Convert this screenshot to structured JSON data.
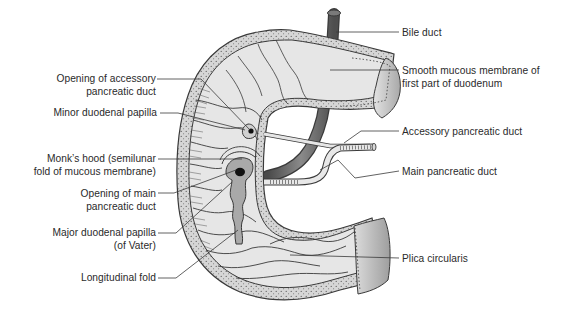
{
  "diagram": {
    "colors": {
      "background": "#ffffff",
      "wall_fill": "#d8d8d8",
      "mucosa_fill": "#e6e6e6",
      "outline": "#3a3a3a",
      "duct_dark": "#6b6b6b",
      "papilla_fill": "#a9a9a9",
      "cut_end_fill": "#bdbdbd",
      "label_text": "#2a2a2a"
    },
    "labels_left": [
      {
        "id": "opening-accessory-duct",
        "lines": [
          "Opening of accessory",
          "pancreatic duct"
        ]
      },
      {
        "id": "minor-duodenal-papilla",
        "lines": [
          "Minor duodenal papilla"
        ]
      },
      {
        "id": "monks-hood",
        "lines": [
          "Monk’s hood (semilunar",
          "fold of mucous membrane)"
        ]
      },
      {
        "id": "opening-main-duct",
        "lines": [
          "Opening of main",
          "pancreatic duct"
        ]
      },
      {
        "id": "major-duodenal-papilla",
        "lines": [
          "Major duodenal papilla",
          "(of Vater)"
        ]
      },
      {
        "id": "longitudinal-fold",
        "lines": [
          "Longitudinal fold"
        ]
      }
    ],
    "labels_right": [
      {
        "id": "bile-duct",
        "lines": [
          "Bile duct"
        ]
      },
      {
        "id": "smooth-mucous-membrane",
        "lines": [
          "Smooth mucous membrane of",
          "first part of duodenum"
        ]
      },
      {
        "id": "accessory-pancreatic-duct",
        "lines": [
          "Accessory pancreatic duct"
        ]
      },
      {
        "id": "main-pancreatic-duct",
        "lines": [
          "Main pancreatic duct"
        ]
      },
      {
        "id": "plica-circularis",
        "lines": [
          "Plica circularis"
        ]
      }
    ]
  }
}
